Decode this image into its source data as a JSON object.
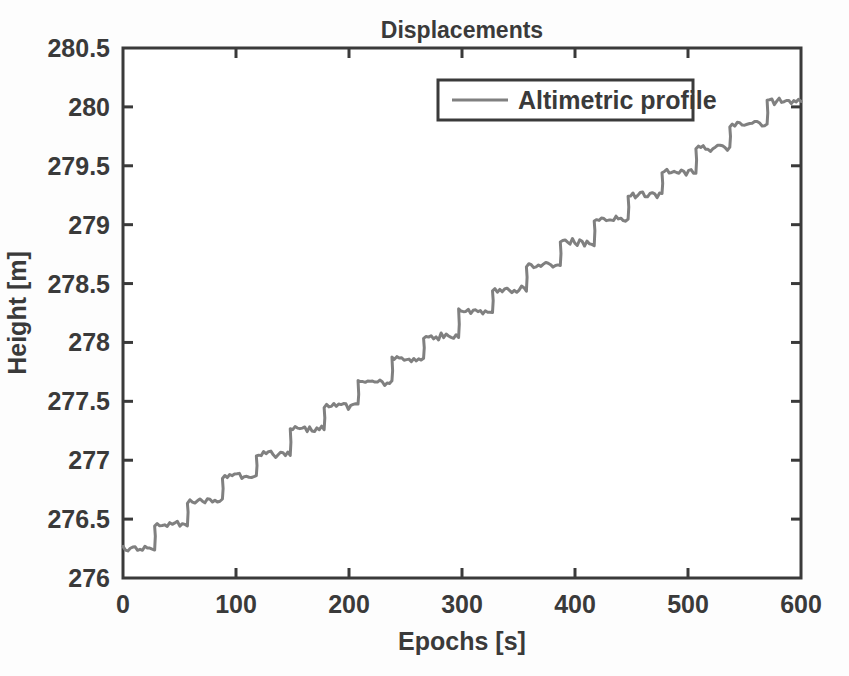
{
  "chart_data": {
    "type": "line",
    "title": "Displacements",
    "xlabel": "Epochs [s]",
    "ylabel": "Height [m]",
    "xlim": [
      0,
      600
    ],
    "ylim": [
      276,
      280.5
    ],
    "xticks": [
      0,
      100,
      200,
      300,
      400,
      500,
      600
    ],
    "xtick_labels": [
      "0",
      "100",
      "200",
      "300",
      "400",
      "500",
      "600"
    ],
    "yticks": [
      276,
      276.5,
      277,
      277.5,
      278,
      278.5,
      279,
      279.5,
      280,
      280.5
    ],
    "ytick_labels": [
      "276",
      "276.5",
      "277",
      "277.5",
      "278",
      "278.5",
      "279",
      "279.5",
      "280",
      "280.5"
    ],
    "grid": false,
    "legend": {
      "position": "top-right-inside",
      "entries": [
        {
          "name": "Altimetric profile",
          "color": "#808080"
        }
      ]
    },
    "series": [
      {
        "name": "Altimetric profile",
        "color": "#808080",
        "line_width": 3,
        "description": "Monotonic staircase: ~20 discrete steps of about 0.19 m each, rising from 276.25 m at epoch 0 to 280.05 m at epoch 600; each plateau is ~30 s long and carries measurement noise of about +/- 0.025 m.",
        "step_plateaus": [
          {
            "x_start": 0,
            "x_end": 28,
            "level": 276.25
          },
          {
            "x_start": 28,
            "x_end": 57,
            "level": 276.46
          },
          {
            "x_start": 57,
            "x_end": 88,
            "level": 276.66
          },
          {
            "x_start": 88,
            "x_end": 118,
            "level": 276.86
          },
          {
            "x_start": 118,
            "x_end": 148,
            "level": 277.05
          },
          {
            "x_start": 148,
            "x_end": 178,
            "level": 277.26
          },
          {
            "x_start": 178,
            "x_end": 208,
            "level": 277.46
          },
          {
            "x_start": 208,
            "x_end": 238,
            "level": 277.66
          },
          {
            "x_start": 238,
            "x_end": 266,
            "level": 277.86
          },
          {
            "x_start": 266,
            "x_end": 297,
            "level": 278.05
          },
          {
            "x_start": 297,
            "x_end": 327,
            "level": 278.26
          },
          {
            "x_start": 327,
            "x_end": 357,
            "level": 278.45
          },
          {
            "x_start": 357,
            "x_end": 387,
            "level": 278.66
          },
          {
            "x_start": 387,
            "x_end": 417,
            "level": 278.85
          },
          {
            "x_start": 417,
            "x_end": 447,
            "level": 279.05
          },
          {
            "x_start": 447,
            "x_end": 477,
            "level": 279.25
          },
          {
            "x_start": 477,
            "x_end": 507,
            "level": 279.45
          },
          {
            "x_start": 507,
            "x_end": 537,
            "level": 279.65
          },
          {
            "x_start": 537,
            "x_end": 570,
            "level": 279.85
          },
          {
            "x_start": 570,
            "x_end": 600,
            "level": 280.05
          }
        ]
      }
    ]
  },
  "style": {
    "axis_color": "#3a3a3a",
    "line_color": "#808080",
    "background": "#fdfdfd",
    "plot_background": "#ffffff"
  }
}
